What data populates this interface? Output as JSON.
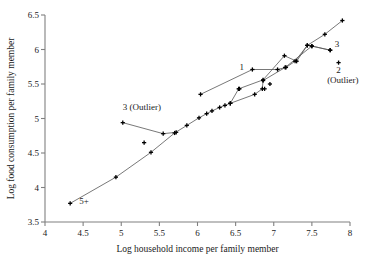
{
  "chart_data": {
    "type": "scatter",
    "title": "",
    "xlabel": "Log household income per family member",
    "ylabel": "Log food consumption per family member",
    "xlim": [
      4,
      8
    ],
    "ylim": [
      3.5,
      6.5
    ],
    "xticks": [
      "4",
      "4.5",
      "5",
      "5.5",
      "6",
      "6.5",
      "7",
      "7.5",
      "8"
    ],
    "xtick_values": [
      4,
      4.5,
      5,
      5.5,
      6,
      6.5,
      7,
      7.5,
      8
    ],
    "yticks": [
      "3.5",
      "4",
      "4.5",
      "5",
      "5.5",
      "6",
      "6.5"
    ],
    "ytick_values": [
      3.5,
      4,
      4.5,
      5,
      5.5,
      6,
      6.5
    ],
    "grid": false,
    "legend_position": "in-plot-annotations",
    "marker": "plus",
    "marker_color": "#000000",
    "line_color": "#555555",
    "frame_color": "#808080",
    "series": [
      {
        "name": "5+",
        "label": "5+",
        "label_x": 4.45,
        "label_y": 3.76,
        "connected": true,
        "points": [
          [
            4.33,
            3.77
          ],
          [
            4.93,
            4.15
          ],
          [
            5.39,
            4.51
          ],
          [
            5.7,
            4.79
          ],
          [
            5.86,
            4.9
          ],
          [
            6.02,
            5.01
          ],
          [
            6.12,
            5.07
          ],
          [
            6.19,
            5.11
          ],
          [
            6.29,
            5.16
          ],
          [
            6.36,
            5.19
          ],
          [
            6.43,
            5.22
          ],
          [
            6.54,
            5.43
          ],
          [
            6.86,
            5.56
          ],
          [
            7.14,
            5.91
          ],
          [
            7.3,
            5.83
          ],
          [
            7.44,
            6.06
          ],
          [
            7.5,
            6.05
          ],
          [
            7.74,
            5.99
          ]
        ]
      },
      {
        "name": "1",
        "label": "1",
        "label_x": 6.55,
        "label_y": 5.7,
        "connected": true,
        "points": [
          [
            6.04,
            5.35
          ],
          [
            6.72,
            5.71
          ],
          [
            7.05,
            5.71
          ],
          [
            7.16,
            5.74
          ],
          [
            7.28,
            5.83
          ],
          [
            7.44,
            6.06
          ],
          [
            7.67,
            6.22
          ],
          [
            7.9,
            6.42
          ]
        ]
      },
      {
        "name": "3",
        "label": "3",
        "label_x": 7.8,
        "label_y": 6.03,
        "connected": true,
        "points": [
          [
            6.43,
            5.22
          ],
          [
            6.75,
            5.35
          ],
          [
            6.85,
            5.43
          ],
          [
            6.86,
            5.55
          ],
          [
            7.15,
            5.74
          ],
          [
            7.5,
            6.05
          ],
          [
            7.74,
            5.99
          ]
        ]
      },
      {
        "name": "3 (Outlier)",
        "label": "3 (Outlier)",
        "label_x": 5.02,
        "label_y": 5.12,
        "connected": true,
        "points": [
          [
            5.02,
            4.94
          ],
          [
            5.55,
            4.78
          ],
          [
            5.72,
            4.8
          ]
        ]
      },
      {
        "name": "2 (Outlier)",
        "label": "2",
        "label2": "(Outlier)",
        "label_x": 7.82,
        "label_y": 5.66,
        "label2_x": 7.7,
        "label2_y": 5.52,
        "connected": false,
        "points": [
          [
            7.85,
            5.81
          ]
        ]
      },
      {
        "name": "unconnected-extra",
        "label": "",
        "connected": false,
        "points": [
          [
            5.3,
            4.65
          ],
          [
            6.55,
            5.43
          ],
          [
            6.88,
            5.43
          ],
          [
            6.95,
            5.5
          ]
        ]
      }
    ],
    "annotations": [
      {
        "text": "5+",
        "x": 4.45,
        "y": 3.76
      },
      {
        "text": "1",
        "x": 6.55,
        "y": 5.7
      },
      {
        "text": "3",
        "x": 7.8,
        "y": 6.03
      },
      {
        "text": "2",
        "x": 7.82,
        "y": 5.66
      },
      {
        "text": "(Outlier)",
        "x": 7.7,
        "y": 5.52
      },
      {
        "text": "3 (Outlier)",
        "x": 5.02,
        "y": 5.12
      }
    ]
  }
}
